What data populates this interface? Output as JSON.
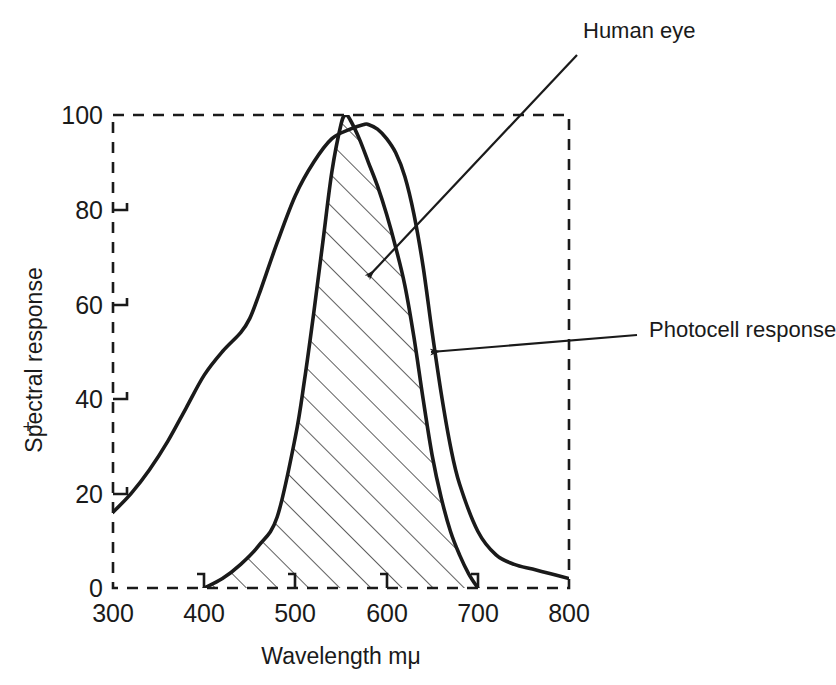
{
  "chart_data": {
    "type": "line",
    "title": "",
    "xlabel": "Wavelength mμ",
    "ylabel": "Spectral response",
    "ylabel_prefix": "+",
    "xlim": [
      300,
      800
    ],
    "ylim": [
      0,
      100
    ],
    "xticks": [
      300,
      400,
      500,
      600,
      700,
      800
    ],
    "xtick_labels": [
      "300",
      "400",
      "500",
      "600",
      "700",
      "800"
    ],
    "yticks": [
      0,
      20,
      40,
      60,
      80,
      100
    ],
    "ytick_labels": [
      "0",
      "20",
      "40",
      "60",
      "80",
      "100"
    ],
    "grid": false,
    "frame_style": "dashed",
    "legend_position": "annotations",
    "series": [
      {
        "name": "Human eye",
        "fill": "hatched",
        "hatch_angle_deg": 45,
        "x": [
          400,
          420,
          440,
          460,
          480,
          500,
          510,
          520,
          530,
          540,
          550,
          555,
          560,
          570,
          580,
          590,
          600,
          610,
          620,
          630,
          640,
          650,
          660,
          670,
          680,
          690,
          700
        ],
        "y": [
          0,
          2,
          5,
          9,
          15,
          32,
          44,
          58,
          73,
          88,
          98,
          100,
          99,
          95,
          90,
          85,
          79,
          72,
          64,
          53,
          40,
          28,
          19,
          12,
          7,
          3,
          0
        ]
      },
      {
        "name": "Photocell response",
        "fill": "none",
        "x": [
          300,
          320,
          340,
          360,
          380,
          400,
          420,
          440,
          450,
          460,
          480,
          500,
          520,
          540,
          560,
          575,
          580,
          590,
          600,
          610,
          620,
          630,
          640,
          650,
          660,
          670,
          680,
          700,
          720,
          740,
          760,
          780,
          800
        ],
        "y": [
          16,
          20,
          25,
          31,
          38,
          45,
          50,
          54,
          57,
          62,
          73,
          83,
          90,
          95,
          97,
          98,
          98,
          97,
          95,
          92,
          87,
          79,
          68,
          54,
          41,
          30,
          22,
          12,
          7,
          5,
          4,
          3,
          2
        ]
      }
    ],
    "annotations": [
      {
        "label": "Human eye",
        "text_x": 583,
        "text_y": 38,
        "arrow_from_x": 577,
        "arrow_from_y": 55,
        "arrow_to_x": 368,
        "arrow_to_y": 277
      },
      {
        "label": "Photocell response",
        "text_x": 649,
        "text_y": 337,
        "arrow_from_x": 637,
        "arrow_from_y": 335,
        "arrow_to_x": 431,
        "arrow_to_y": 352
      }
    ]
  },
  "colors": {
    "curve": "#1a1a1a",
    "frame": "#1a1a1a",
    "hatch": "#1a1a1a",
    "background": "#ffffff",
    "text": "#1a1a1a"
  }
}
